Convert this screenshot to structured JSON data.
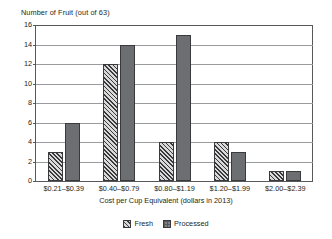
{
  "chart_data": {
    "type": "bar",
    "title": "",
    "ylabel": "Number of Fruit (out of 63)",
    "xlabel": "Cost per Cup Equivalent (dollars in 2013)",
    "categories": [
      "$0.21–$0.39",
      "$0.40–$0.79",
      "$0.80–$1.19",
      "$1.20–$1.99",
      "$2.00–$2.39"
    ],
    "series": [
      {
        "name": "Fresh",
        "values": [
          3,
          12,
          4,
          4,
          1
        ],
        "color": "#4d4d4f",
        "pattern": "diagonal-hatch"
      },
      {
        "name": "Processed",
        "values": [
          6,
          14,
          15,
          3,
          1
        ],
        "color": "#6d6e71",
        "pattern": "solid"
      }
    ],
    "ylim": [
      0,
      16
    ],
    "yticks": [
      0,
      2,
      4,
      6,
      8,
      10,
      12,
      14,
      16
    ],
    "grid": "horizontal",
    "legend_position": "bottom-center"
  },
  "legend": {
    "items": [
      {
        "label": "Fresh"
      },
      {
        "label": "Processed"
      }
    ]
  }
}
